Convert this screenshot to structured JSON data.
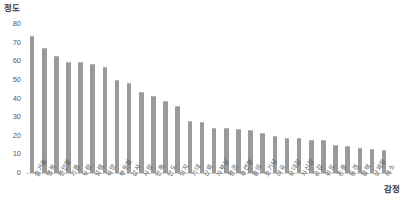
{
  "chart_data": {
    "type": "bar",
    "title": "",
    "ylabel": "정도",
    "xlabel": "감정",
    "ylim": [
      0,
      80
    ],
    "yticks": [
      80,
      70,
      60,
      50,
      40,
      30,
      20,
      10,
      0
    ],
    "grid": false,
    "legend": "none",
    "bar_color": "#9a9a9a",
    "categories": [
      "즐거움",
      "행복",
      "편안함",
      "기쁨",
      "보람",
      "설렘",
      "희망",
      "뿌듯함",
      "감사",
      "사랑",
      "만족",
      "안도",
      "의지",
      "기대",
      "신뢰",
      "자부심",
      "평온",
      "후련함",
      "흥미",
      "호기심",
      "여유",
      "유대감",
      "자신감",
      "공감",
      "위로",
      "존중",
      "동경",
      "활력",
      "상쾌함",
      "해소"
    ],
    "values": [
      73.5,
      67,
      63,
      59.5,
      59.5,
      58.5,
      57,
      50,
      48.5,
      43.5,
      41.5,
      38.5,
      36,
      28,
      27.5,
      24,
      24,
      23.5,
      23,
      21.5,
      20,
      19,
      19,
      17.5,
      17.5,
      15,
      14.5,
      13.5,
      13,
      12.5
    ]
  }
}
